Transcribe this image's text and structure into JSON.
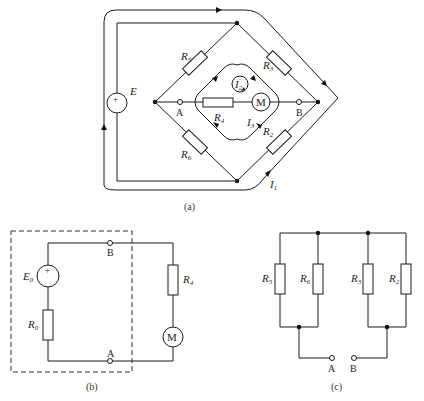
{
  "figure_a": {
    "caption": "(a)",
    "source": {
      "label": "E",
      "polarity": "+"
    },
    "resistors": [
      {
        "label": "R",
        "sub": "5"
      },
      {
        "label": "R",
        "sub": "3"
      },
      {
        "label": "R",
        "sub": "4"
      },
      {
        "label": "R",
        "sub": "6"
      },
      {
        "label": "R",
        "sub": "2"
      }
    ],
    "motor": {
      "label": "M"
    },
    "terminals": [
      {
        "label": "A"
      },
      {
        "label": "B"
      }
    ],
    "currents": [
      {
        "label": "I",
        "sub": "1"
      },
      {
        "label": "I",
        "sub": "2"
      },
      {
        "label": "I",
        "sub": "3"
      }
    ]
  },
  "figure_b": {
    "caption": "(b)",
    "source": {
      "label": "E",
      "sub": "0",
      "polarity": "+"
    },
    "resistors": [
      {
        "label": "R",
        "sub": "0"
      },
      {
        "label": "R",
        "sub": "4"
      }
    ],
    "motor": {
      "label": "M"
    },
    "terminals": [
      {
        "label": "B"
      },
      {
        "label": "A"
      }
    ]
  },
  "figure_c": {
    "caption": "(c)",
    "resistors": [
      {
        "label": "R",
        "sub": "5"
      },
      {
        "label": "R",
        "sub": "6"
      },
      {
        "label": "R",
        "sub": "3"
      },
      {
        "label": "R",
        "sub": "2"
      }
    ],
    "terminals": [
      {
        "label": "A"
      },
      {
        "label": "B"
      }
    ]
  }
}
